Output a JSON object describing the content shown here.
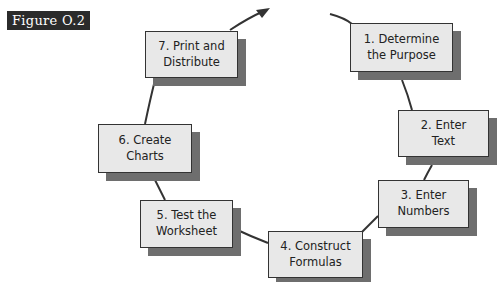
{
  "figure_label": "Figure O.2",
  "steps": [
    {
      "line1": "1. Determine",
      "line2": "the Purpose"
    },
    {
      "line1": "2. Enter",
      "line2": "Text"
    },
    {
      "line1": "3. Enter",
      "line2": "Numbers"
    },
    {
      "line1": "4. Construct",
      "line2": "Formulas"
    },
    {
      "line1": "5. Test the",
      "line2": "Worksheet"
    },
    {
      "line1": "6. Create",
      "line2": "Charts"
    },
    {
      "line1": "7. Print and",
      "line2": "Distribute"
    }
  ],
  "colors": {
    "box_fill": "#e8e8e8",
    "shadow": "#6e6e6e",
    "label_bg": "#2b2b2b"
  }
}
